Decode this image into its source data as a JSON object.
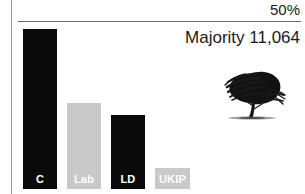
{
  "chart_data": {
    "type": "bar",
    "title": "",
    "subtitle": "",
    "xlabel": "",
    "ylabel": "",
    "categories": [
      "C",
      "Lab",
      "LD",
      "UKIP"
    ],
    "values": [
      48.5,
      27.5,
      20.5,
      0
    ],
    "ylim": [
      0,
      50
    ],
    "grid": false,
    "legend": "none",
    "annotations": {
      "threshold_label": "50%",
      "majority_label": "Majority 11,064"
    },
    "bar_colors": [
      "#0a0a0a",
      "#c9c9c9",
      "#0a0a0a",
      "#c9c9c9"
    ],
    "series": [
      {
        "name": "Vote share",
        "values": [
          48.5,
          27.5,
          20.5,
          0
        ]
      }
    ]
  },
  "axis": {
    "threshold": {
      "label": "50%",
      "value": 50
    }
  },
  "caption": {
    "majority": "Majority 11,064"
  },
  "bars": [
    {
      "key": "c",
      "label": "C",
      "style": "dark",
      "left": 23,
      "width": 34,
      "top": 29,
      "value": 48.5
    },
    {
      "key": "lab",
      "label": "Lab",
      "style": "grey",
      "left": 67,
      "width": 34,
      "top": 103,
      "value": 27.5
    },
    {
      "key": "ld",
      "label": "LD",
      "style": "dark",
      "left": 111,
      "width": 34,
      "top": 115,
      "value": 20.5
    },
    {
      "key": "ukip",
      "label": "UKIP",
      "style": "grey",
      "left": 155,
      "width": 35,
      "top": 168,
      "value": 0
    }
  ],
  "emblem": {
    "name": "oak-tree-icon",
    "color": "#111111"
  },
  "colors": {
    "dark": "#0a0a0a",
    "grey": "#c9c9c9",
    "rule": "#6b6b6b",
    "divider": "#9a9a9a",
    "text": "#1a1a1a",
    "background": "#ffffff"
  }
}
